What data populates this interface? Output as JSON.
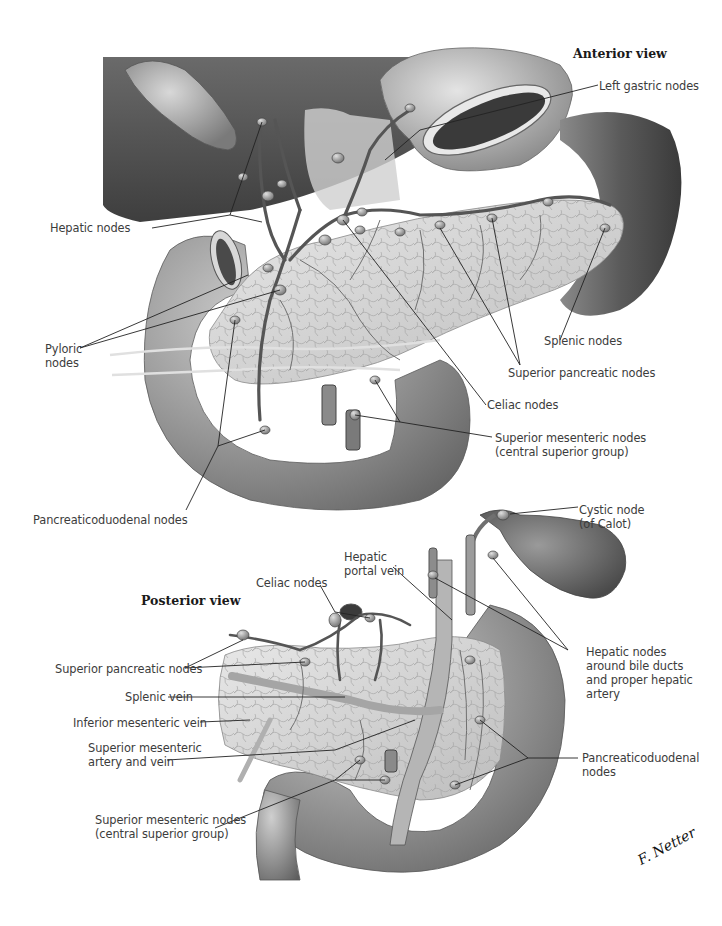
{
  "anterior_view": {
    "title": "Anterior view",
    "labels": {
      "left_gastric_nodes": "Left gastric nodes",
      "hepatic_nodes": "Hepatic nodes",
      "pyloric_nodes": "Pyloric\nnodes",
      "splenic_nodes": "Splenic nodes",
      "superior_pancreatic_nodes": "Superior pancreatic nodes",
      "celiac_nodes": "Celiac nodes",
      "superior_mesenteric_nodes": "Superior mesenteric nodes\n(central superior group)",
      "pancreaticoduodenal_nodes": "Pancreaticoduodenal nodes"
    }
  },
  "posterior_view": {
    "title": "Posterior view",
    "labels": {
      "cystic_node": "Cystic node\n(of Calot)",
      "hepatic_portal_vein": "Hepatic\nportal vein",
      "celiac_nodes": "Celiac nodes",
      "superior_pancreatic_nodes": "Superior pancreatic nodes",
      "splenic_vein": "Splenic vein",
      "inferior_mesenteric_vein": "Inferior mesenteric vein",
      "superior_mesenteric_artery_vein": "Superior mesenteric\nartery and vein",
      "superior_mesenteric_nodes": "Superior mesenteric nodes\n(central superior group)",
      "hepatic_nodes_bile_ducts": "Hepatic nodes\naround bile ducts\nand proper hepatic\nartery",
      "pancreaticoduodenal_nodes": "Pancreaticoduodenal\nnodes"
    }
  },
  "signature": "F. Netter",
  "colors": {
    "liver": "#5a5a5a",
    "stomach": "#8a8a8a",
    "duodenum": "#9a9a9a",
    "pancreas": "#d2d2d2",
    "spleen": "#4e4e4e",
    "vessel": "#606060",
    "leader": "#222222"
  }
}
